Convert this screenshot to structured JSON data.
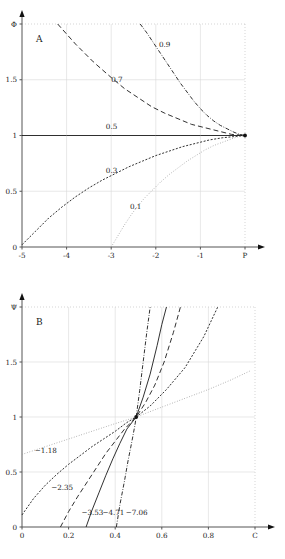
{
  "figure": {
    "panels": [
      {
        "id": "A",
        "letter": "A",
        "xlabel": "P",
        "ylabel": "Φ",
        "x_ticks": [
          "-5",
          "-4",
          "-3",
          "-2",
          "-1",
          "P"
        ],
        "y_ticks": [
          "0",
          "0.5",
          "1",
          "1.5",
          "Φ"
        ],
        "curve_labels": [
          "0.9",
          "0.7",
          "0.5",
          "0.3",
          "0.1"
        ]
      },
      {
        "id": "B",
        "letter": "B",
        "xlabel": "C",
        "ylabel": "Ψ",
        "x_ticks": [
          "0",
          "0.2",
          "0.4",
          "0.6",
          "0.8",
          "C"
        ],
        "y_ticks": [
          "0",
          "0.5",
          "1",
          "1.5",
          "Ψ"
        ],
        "curve_labels": [
          "−1.18",
          "−2.35",
          "−3.53",
          "−4.71",
          "−7.06"
        ]
      }
    ]
  },
  "chart_data": [
    {
      "type": "line",
      "panel": "A",
      "title": "A",
      "xlabel": "P",
      "ylabel": "Φ",
      "xlim": [
        -5,
        0
      ],
      "ylim": [
        0,
        2
      ],
      "xticks": [
        -5,
        -4,
        -3,
        -2,
        -1,
        0
      ],
      "xticklabels": [
        "-5",
        "-4",
        "-3",
        "-2",
        "-1",
        "P"
      ],
      "yticks": [
        0,
        0.5,
        1,
        1.5,
        2
      ],
      "yticklabels": [
        "0",
        "0.5",
        "1",
        "1.5",
        "Φ"
      ],
      "grid": true,
      "legend": "inline-curve-labels",
      "convergence_point": [
        0,
        1
      ],
      "series": [
        {
          "name": "0.9",
          "label": "0.9",
          "linestyle": "dashdot",
          "label_xy": [
            -1.93,
            1.79
          ],
          "x": [
            -2.35,
            -2.2,
            -2.05,
            -1.9,
            -1.75,
            -1.6,
            -1.45,
            -1.3,
            -1.15,
            -1.0,
            -0.85,
            -0.7,
            -0.55,
            -0.4,
            -0.25,
            -0.12,
            0
          ],
          "y": [
            2.0,
            1.92,
            1.83,
            1.74,
            1.65,
            1.56,
            1.47,
            1.39,
            1.31,
            1.24,
            1.18,
            1.13,
            1.09,
            1.06,
            1.03,
            1.01,
            1.0
          ]
        },
        {
          "name": "0.7",
          "label": "0.7",
          "linestyle": "dashed",
          "label_xy": [
            -3.0,
            1.48
          ],
          "x": [
            -4.2,
            -4.0,
            -3.8,
            -3.6,
            -3.4,
            -3.2,
            -3.0,
            -2.7,
            -2.4,
            -2.1,
            -1.8,
            -1.5,
            -1.2,
            -0.9,
            -0.6,
            -0.3,
            0
          ],
          "y": [
            2.0,
            1.91,
            1.82,
            1.74,
            1.66,
            1.59,
            1.52,
            1.42,
            1.34,
            1.26,
            1.2,
            1.15,
            1.1,
            1.07,
            1.04,
            1.01,
            1.0
          ]
        },
        {
          "name": "0.5",
          "label": "0.5",
          "linestyle": "solid",
          "label_xy": [
            -3.12,
            1.06
          ],
          "x": [
            -5,
            -4,
            -3,
            -2,
            -1,
            0
          ],
          "y": [
            1.0,
            1.0,
            1.0,
            1.0,
            1.0,
            1.0
          ]
        },
        {
          "name": "0.3",
          "label": "0.3",
          "linestyle": "dashed-small",
          "label_xy": [
            -3.12,
            0.66
          ],
          "x": [
            -5.0,
            -4.7,
            -4.4,
            -4.1,
            -3.8,
            -3.5,
            -3.2,
            -2.9,
            -2.6,
            -2.3,
            -2.0,
            -1.7,
            -1.4,
            -1.1,
            -0.8,
            -0.5,
            -0.25,
            0
          ],
          "y": [
            0.02,
            0.14,
            0.26,
            0.36,
            0.45,
            0.53,
            0.6,
            0.66,
            0.72,
            0.77,
            0.82,
            0.86,
            0.9,
            0.93,
            0.96,
            0.98,
            0.99,
            1.0
          ]
        },
        {
          "name": "0.1",
          "label": "0.1",
          "linestyle": "dotted",
          "label_xy": [
            -2.58,
            0.34
          ],
          "x": [
            -3.0,
            -2.85,
            -2.7,
            -2.55,
            -2.4,
            -2.25,
            -2.1,
            -1.9,
            -1.7,
            -1.5,
            -1.3,
            -1.1,
            -0.9,
            -0.7,
            -0.5,
            -0.3,
            -0.15,
            0
          ],
          "y": [
            0.0,
            0.1,
            0.2,
            0.29,
            0.37,
            0.44,
            0.5,
            0.58,
            0.65,
            0.71,
            0.77,
            0.82,
            0.87,
            0.91,
            0.94,
            0.97,
            0.99,
            1.0
          ]
        }
      ]
    },
    {
      "type": "line",
      "panel": "B",
      "title": "B",
      "xlabel": "C",
      "ylabel": "Ψ",
      "xlim": [
        0,
        1
      ],
      "ylim": [
        0,
        2
      ],
      "xticks": [
        0,
        0.2,
        0.4,
        0.6,
        0.8,
        1.0
      ],
      "xticklabels": [
        "0",
        "0.2",
        "0.4",
        "0.6",
        "0.8",
        "C"
      ],
      "yticks": [
        0,
        0.5,
        1,
        1.5,
        2
      ],
      "yticklabels": [
        "0",
        "0.5",
        "1",
        "1.5",
        "Ψ"
      ],
      "grid": true,
      "legend": "inline-curve-labels",
      "convergence_point": [
        0.49,
        1.0
      ],
      "series": [
        {
          "name": "-1.18",
          "label": "−1.18",
          "linestyle": "dotted",
          "label_xy": [
            0.055,
            0.675
          ],
          "x": [
            0.0,
            0.1,
            0.2,
            0.3,
            0.4,
            0.49,
            0.6,
            0.7,
            0.8,
            0.9,
            0.98
          ],
          "y": [
            0.66,
            0.73,
            0.8,
            0.87,
            0.94,
            1.0,
            1.09,
            1.17,
            1.25,
            1.34,
            1.42
          ]
        },
        {
          "name": "-2.35",
          "label": "−2.35",
          "linestyle": "dashed-small",
          "label_xy": [
            0.125,
            0.34
          ],
          "x": [
            0.0,
            0.05,
            0.1,
            0.15,
            0.2,
            0.25,
            0.3,
            0.35,
            0.4,
            0.45,
            0.49,
            0.55,
            0.62,
            0.7,
            0.78,
            0.84
          ],
          "y": [
            0.11,
            0.26,
            0.38,
            0.48,
            0.57,
            0.65,
            0.73,
            0.8,
            0.87,
            0.95,
            1.0,
            1.1,
            1.25,
            1.45,
            1.73,
            2.0
          ]
        },
        {
          "name": "-3.53",
          "label": "−3.53",
          "linestyle": "dashed",
          "label_xy": [
            0.255,
            0.11
          ],
          "x": [
            0.165,
            0.2,
            0.24,
            0.28,
            0.32,
            0.36,
            0.4,
            0.44,
            0.49,
            0.53,
            0.57,
            0.61,
            0.65,
            0.68
          ],
          "y": [
            0.0,
            0.14,
            0.28,
            0.41,
            0.54,
            0.67,
            0.78,
            0.89,
            1.0,
            1.13,
            1.29,
            1.5,
            1.77,
            2.0
          ]
        },
        {
          "name": "-4.71",
          "label": "−4.71",
          "linestyle": "solid",
          "label_xy": [
            0.345,
            0.11
          ],
          "x": [
            0.275,
            0.3,
            0.33,
            0.36,
            0.39,
            0.42,
            0.45,
            0.49,
            0.52,
            0.55,
            0.58,
            0.6,
            0.62
          ],
          "y": [
            0.0,
            0.15,
            0.31,
            0.47,
            0.62,
            0.76,
            0.89,
            1.0,
            1.18,
            1.39,
            1.65,
            1.84,
            2.0
          ]
        },
        {
          "name": "-7.06",
          "label": "−7.06",
          "linestyle": "dashdot",
          "label_xy": [
            0.445,
            0.11
          ],
          "x": [
            0.405,
            0.42,
            0.44,
            0.455,
            0.47,
            0.485,
            0.49,
            0.505,
            0.52,
            0.535,
            0.55
          ],
          "y": [
            0.0,
            0.2,
            0.42,
            0.6,
            0.76,
            0.93,
            1.0,
            1.24,
            1.5,
            1.76,
            2.0
          ]
        }
      ]
    }
  ]
}
